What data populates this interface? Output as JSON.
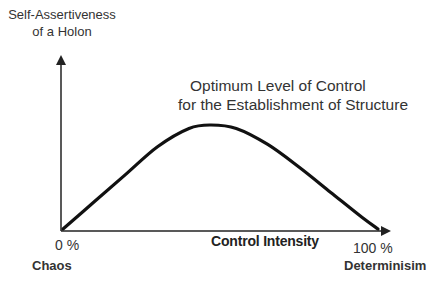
{
  "chart_data": {
    "type": "line",
    "title": "Optimum Level of Control for the Establishment of Structure",
    "title_lines": [
      "Optimum Level of Control",
      "for the Establishment of Structure"
    ],
    "ylabel": "Self-Assertiveness of a Holon",
    "ylabel_lines": [
      "Self-Assertiveness",
      "of a Holon"
    ],
    "xlabel": "Control Intensity",
    "x_ticks": [
      {
        "value": "0 %",
        "label": "Chaos"
      },
      {
        "value": "100 %",
        "label": "Determinisim"
      }
    ],
    "x": [
      0,
      10,
      20,
      30,
      40,
      47,
      55,
      65,
      75,
      85,
      95,
      100
    ],
    "values": [
      0,
      24,
      48,
      72,
      88,
      91,
      88,
      74,
      54,
      32,
      10,
      0
    ],
    "xlim": [
      0,
      100
    ],
    "grid": false,
    "legend": null
  }
}
